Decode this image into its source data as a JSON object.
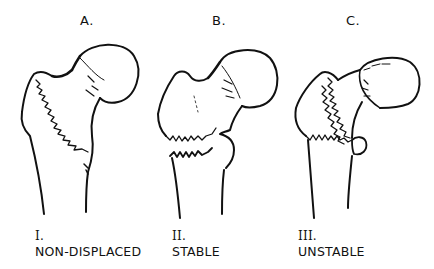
{
  "figure": {
    "panels": [
      {
        "letter": "A.",
        "roman": "I.",
        "label": "NON-DISPLACED"
      },
      {
        "letter": "B.",
        "roman": "II.",
        "label": "STABLE"
      },
      {
        "letter": "C.",
        "roman": "III.",
        "label": "UNSTABLE"
      }
    ]
  }
}
